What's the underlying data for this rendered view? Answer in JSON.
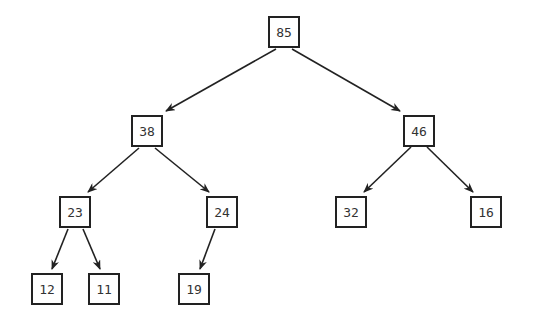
{
  "diagram": {
    "type": "binary-tree",
    "title": "",
    "colors": {
      "stroke": "#222222",
      "text": "#333333",
      "background": "#ffffff"
    },
    "nodes": [
      {
        "id": "n85",
        "label": "85",
        "cx": 284,
        "cy": 32
      },
      {
        "id": "n38",
        "label": "38",
        "cx": 147,
        "cy": 131
      },
      {
        "id": "n46",
        "label": "46",
        "cx": 419,
        "cy": 131
      },
      {
        "id": "n23",
        "label": "23",
        "cx": 75,
        "cy": 212
      },
      {
        "id": "n24",
        "label": "24",
        "cx": 222,
        "cy": 212
      },
      {
        "id": "n32",
        "label": "32",
        "cx": 351,
        "cy": 212
      },
      {
        "id": "n16",
        "label": "16",
        "cx": 486,
        "cy": 212
      },
      {
        "id": "n12",
        "label": "12",
        "cx": 47,
        "cy": 289
      },
      {
        "id": "n11",
        "label": "11",
        "cx": 104,
        "cy": 289
      },
      {
        "id": "n19",
        "label": "19",
        "cx": 194,
        "cy": 289
      }
    ],
    "edges": [
      {
        "from": "n85",
        "to": "n38",
        "x1": 276,
        "y1": 49,
        "x2": 166,
        "y2": 111
      },
      {
        "from": "n85",
        "to": "n46",
        "x1": 292,
        "y1": 49,
        "x2": 400,
        "y2": 111
      },
      {
        "from": "n38",
        "to": "n23",
        "x1": 139,
        "y1": 148,
        "x2": 88,
        "y2": 192
      },
      {
        "from": "n38",
        "to": "n24",
        "x1": 155,
        "y1": 148,
        "x2": 209,
        "y2": 192
      },
      {
        "from": "n46",
        "to": "n32",
        "x1": 411,
        "y1": 147,
        "x2": 364,
        "y2": 192
      },
      {
        "from": "n46",
        "to": "n16",
        "x1": 427,
        "y1": 147,
        "x2": 473,
        "y2": 192
      },
      {
        "from": "n23",
        "to": "n12",
        "x1": 68,
        "y1": 229,
        "x2": 52,
        "y2": 269
      },
      {
        "from": "n23",
        "to": "n11",
        "x1": 83,
        "y1": 229,
        "x2": 100,
        "y2": 269
      },
      {
        "from": "n24",
        "to": "n19",
        "x1": 215,
        "y1": 229,
        "x2": 200,
        "y2": 269
      }
    ]
  }
}
